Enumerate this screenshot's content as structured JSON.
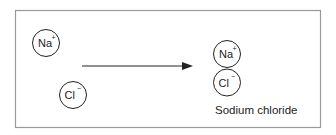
{
  "diagram": {
    "type": "reaction",
    "reactants": [
      {
        "symbol": "Na",
        "charge": "+",
        "cx": 46,
        "cy": 43
      },
      {
        "symbol": "Cl",
        "charge": "−",
        "cx": 73,
        "cy": 95
      }
    ],
    "arrow": {
      "x1": 82,
      "y1": 66,
      "x2": 193,
      "y2": 66
    },
    "product": {
      "ions": [
        {
          "symbol": "Na",
          "charge": "+",
          "cx": 227,
          "cy": 54
        },
        {
          "symbol": "Cl",
          "charge": "−",
          "cx": 227,
          "cy": 83
        }
      ],
      "label": "Sodium chloride"
    },
    "colors": {
      "border": "#9a9a9a",
      "stroke": "#222222",
      "text": "#222222"
    }
  }
}
